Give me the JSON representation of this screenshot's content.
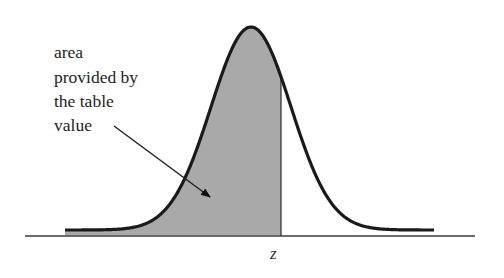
{
  "diagram": {
    "type": "normal-distribution-shaded-area",
    "annotation": {
      "lines": [
        "area",
        "provided by",
        "the table",
        "value"
      ]
    },
    "z_label": "z",
    "colors": {
      "curve": "#1a1a1a",
      "shade": "#a9a9a9",
      "axis": "#3a3a3a",
      "text": "#1e1e1e",
      "background": "#ffffff"
    },
    "geometry": {
      "axis": {
        "x1": 25,
        "x2": 475,
        "y": 236
      },
      "curve": {
        "x_start": 65,
        "x_end": 434,
        "mean_x": 251,
        "sigma_px": 40,
        "peak_y": 27,
        "base_y": 230
      },
      "z_x": 281,
      "arrow": {
        "x1": 114,
        "y1": 126,
        "x2": 210,
        "y2": 197
      }
    }
  }
}
